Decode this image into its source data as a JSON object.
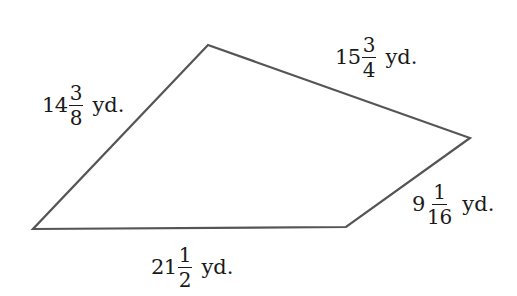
{
  "figure": {
    "type": "quadrilateral",
    "stroke_color": "#555555",
    "background": "#ffffff",
    "vertices": [
      {
        "name": "top",
        "x": 208,
        "y": 45
      },
      {
        "name": "right",
        "x": 470,
        "y": 138
      },
      {
        "name": "bottom-right",
        "x": 346,
        "y": 227
      },
      {
        "name": "bottom-left",
        "x": 33,
        "y": 229
      }
    ]
  },
  "sides": [
    {
      "id": "left",
      "whole": "14",
      "numerator": "3",
      "denominator": "8",
      "unit": "yd.",
      "text": "14 3/8 yd."
    },
    {
      "id": "top-right",
      "whole": "15",
      "numerator": "3",
      "denominator": "4",
      "unit": "yd.",
      "text": "15 3/4 yd."
    },
    {
      "id": "lower-right",
      "whole": "9",
      "numerator": "1",
      "denominator": "16",
      "unit": "yd.",
      "text": "9 1/16 yd."
    },
    {
      "id": "bottom",
      "whole": "21",
      "numerator": "1",
      "denominator": "2",
      "unit": "yd.",
      "text": "21 1/2 yd."
    }
  ]
}
